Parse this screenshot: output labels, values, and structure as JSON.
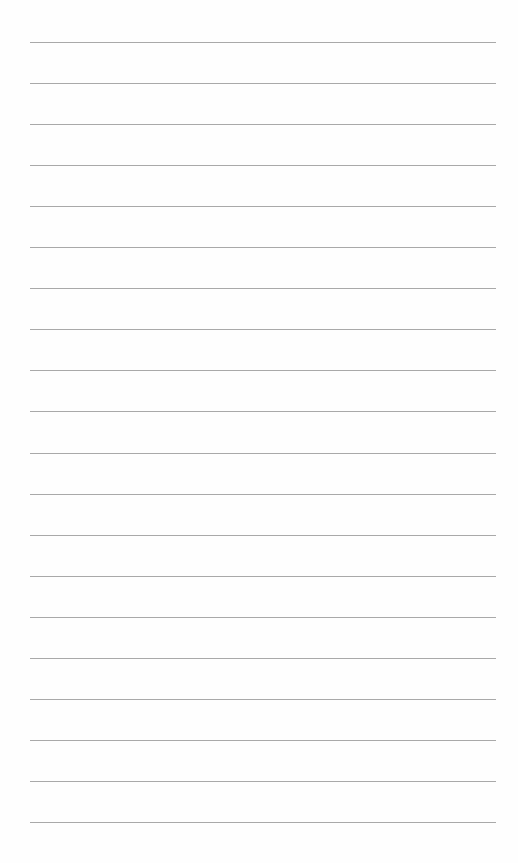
{
  "page": {
    "type": "lined-paper",
    "background_color": "#fefefe",
    "line_color": "#9a9a9a",
    "line_count": 20,
    "line_left_px": 30,
    "line_width_px": 466,
    "first_line_y_px": 42,
    "line_spacing_px": 41.05
  }
}
